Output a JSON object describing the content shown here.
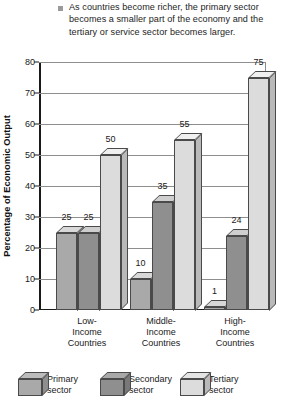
{
  "note": {
    "bullet": "square-bullet",
    "text": "As countries become richer, the primary sector becomes a smaller part of the economy and the tertiary or service sector becomes larger."
  },
  "chart_data": {
    "type": "bar",
    "title": "",
    "xlabel": "",
    "ylabel": "Percentage of Economic Output",
    "ylim": [
      0,
      80
    ],
    "yticks": [
      0,
      10,
      20,
      30,
      40,
      50,
      60,
      70,
      80
    ],
    "grid": true,
    "legend_position": "bottom",
    "categories": [
      "Low-\nIncome\nCountries",
      "Middle-\nIncome\nCountries",
      "High-\nIncome\nCountries"
    ],
    "category_lines": [
      [
        "Low-",
        "Income",
        "Countries"
      ],
      [
        "Middle-",
        "Income",
        "Countries"
      ],
      [
        "High-",
        "Income",
        "Countries"
      ]
    ],
    "series": [
      {
        "name": "Primary sector",
        "values": [
          25,
          10,
          1
        ],
        "color": "#a9a9a9"
      },
      {
        "name": "Secondary sector",
        "values": [
          25,
          35,
          24
        ],
        "color": "#8f8f8f"
      },
      {
        "name": "Tertiary sector",
        "values": [
          50,
          55,
          75
        ],
        "color": "#dcdcdc"
      }
    ],
    "data_labels": [
      [
        "25",
        "25",
        "50"
      ],
      [
        "10",
        "35",
        "55"
      ],
      [
        "1",
        "24",
        "75"
      ]
    ]
  },
  "legend": {
    "items": [
      {
        "line1": "Primary",
        "line2": "sector"
      },
      {
        "line1": "Secondary",
        "line2": "sector"
      },
      {
        "line1": "Tertiary",
        "line2": "sector"
      }
    ]
  }
}
